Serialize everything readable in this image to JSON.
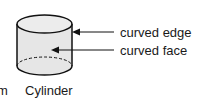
{
  "diagram": {
    "shape_name": "Cylinder",
    "partial_left_label": "m",
    "annotations": [
      {
        "label": "curved edge",
        "target": "top rim"
      },
      {
        "label": "curved face",
        "target": "side surface"
      }
    ],
    "colors": {
      "fill": "#e6e6e6",
      "stroke": "#111111"
    }
  }
}
